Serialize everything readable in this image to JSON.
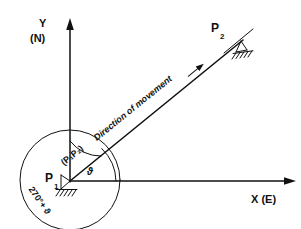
{
  "figure": {
    "type": "engineering-survey-sketch",
    "background_color": "#ffffff",
    "ink_color": "#111111"
  },
  "axes": {
    "y": {
      "label": "Y",
      "sublabel": "(N)",
      "direction": "up",
      "arrow": "solid-arrowhead"
    },
    "x": {
      "label": "X (E)",
      "direction": "right",
      "arrow": "solid-arrowhead"
    },
    "origin_at": "P1"
  },
  "points": [
    {
      "id": "p1",
      "label": "P",
      "subscript": "1",
      "support": "hatched-fixed-support",
      "position_note": "origin"
    },
    {
      "id": "p2",
      "label": "P",
      "subscript": "2",
      "support": "hatched-fixed-support",
      "position_note": "upper-right"
    }
  ],
  "annotations": {
    "direction_text": "Direction of movement",
    "direction_arrow": "inline-arrow-right",
    "bearing_label": "(P₁P₂)",
    "angle_label": "ϑ",
    "azimuth_label": "270°+ ϑ"
  },
  "elements": {
    "circle": {
      "name": "azimuth-circle",
      "centered_on": "P1"
    },
    "angle_arc_theta": {
      "name": "theta-arc",
      "between": [
        "x-axis",
        "P1P2-ray"
      ]
    },
    "angle_arc_bearing": {
      "name": "bearing-arc",
      "between": [
        "y-axis",
        "P1P2-ray"
      ]
    },
    "ray": {
      "name": "p1-p2-ray",
      "from": "P1",
      "to": "P2"
    }
  }
}
